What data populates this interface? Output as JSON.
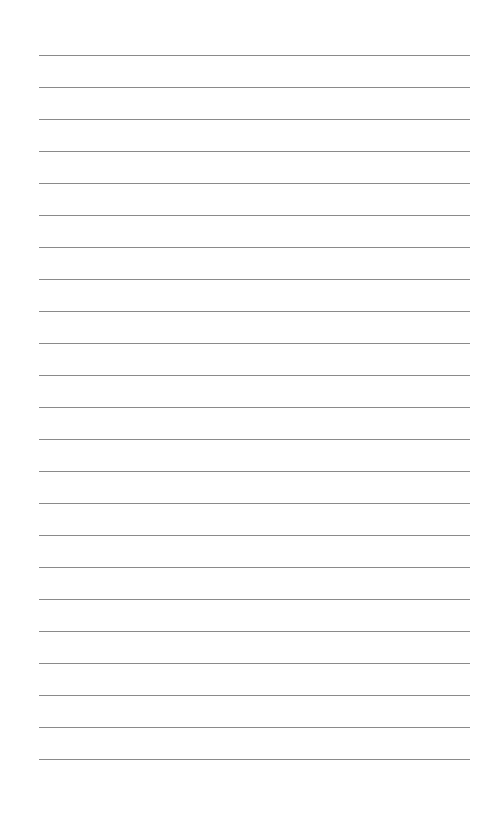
{
  "page": {
    "type": "lined-paper",
    "background_color": "#ffffff",
    "line_color": "#8a8a8a",
    "line_count": 23,
    "first_line_y": 55,
    "line_spacing": 32,
    "line_left": 39,
    "line_right": 470
  }
}
